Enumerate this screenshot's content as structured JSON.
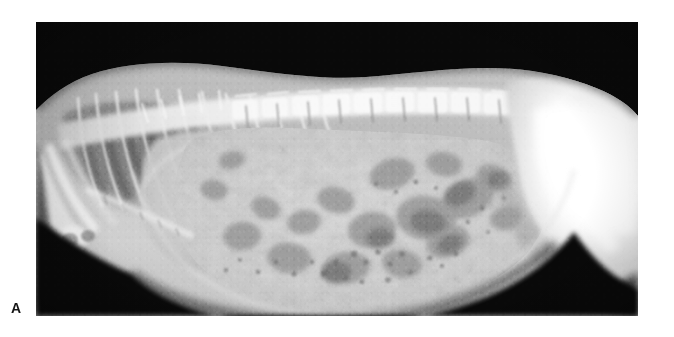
{
  "figure": {
    "panel_label": "A",
    "modality": "radiograph",
    "view": "lateral",
    "background_color": "#ffffff",
    "plate_color": "#000000",
    "plate": {
      "x": 36,
      "y": 22,
      "width": 602,
      "height": 294
    },
    "label_color": "#151515"
  },
  "radiograph": {
    "title": "",
    "caption": "",
    "orientation": "cranial-left-caudal-right",
    "body_region": "thorax-and-abdomen",
    "regions": [
      {
        "name": "background-air",
        "tone": "#000000"
      },
      {
        "name": "dorsal-spine-soft-tissue",
        "tone": "#d8d8d8"
      },
      {
        "name": "thoracic-vertebrae",
        "tone": "#efefef"
      },
      {
        "name": "lumbar-vertebrae",
        "tone": "#f4f4f4"
      },
      {
        "name": "rib-cage",
        "tone": "#dcdcdc"
      },
      {
        "name": "lung-field",
        "tone": "#6e6e6e"
      },
      {
        "name": "cardiac-hepatic-silhouette",
        "tone": "#c9c9c9"
      },
      {
        "name": "abdominal-soft-tissue",
        "tone": "#cfcfcf"
      },
      {
        "name": "gas-filled-bowel-loops",
        "tone": "#8d8d8d"
      },
      {
        "name": "pelvis-hindlimb",
        "tone": "#fbfbfb"
      },
      {
        "name": "forelimb-elbow",
        "tone": "#ededed"
      },
      {
        "name": "sternum",
        "tone": "#e2e2e2"
      }
    ]
  },
  "icons": {
    "panel_marker": "letter-a-marker"
  }
}
